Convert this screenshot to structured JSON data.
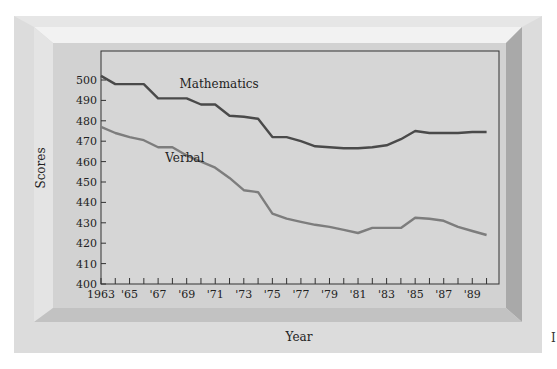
{
  "chart_data": {
    "type": "line",
    "title": "",
    "xlabel": "Year",
    "ylabel": "Scores",
    "ylim": [
      400,
      500
    ],
    "xlim": [
      1963,
      1990
    ],
    "grid": false,
    "legend": "inline labels",
    "y_ticks": [
      "400",
      "410",
      "420",
      "430",
      "440",
      "450",
      "460",
      "470",
      "480",
      "490",
      "500"
    ],
    "x_tick_labels": [
      "1963",
      "'65",
      "'67",
      "'69",
      "'71",
      "'73",
      "'75",
      "'77",
      "'79",
      "'81",
      "'83",
      "'85",
      "'87",
      "'89"
    ],
    "x": [
      1963,
      1964,
      1965,
      1966,
      1967,
      1968,
      1969,
      1970,
      1971,
      1972,
      1973,
      1974,
      1975,
      1976,
      1977,
      1978,
      1979,
      1980,
      1981,
      1982,
      1983,
      1984,
      1985,
      1986,
      1987,
      1988,
      1989,
      1990
    ],
    "series": [
      {
        "name": "Mathematics",
        "color": "#4a4a4a",
        "values": [
          502,
          498,
          498,
          498,
          491,
          491,
          491,
          488,
          488,
          482.5,
          482,
          481,
          472,
          472,
          470,
          467.5,
          467,
          466.5,
          466.5,
          467,
          468,
          471,
          475,
          474,
          474,
          474,
          474.5,
          474.5
        ]
      },
      {
        "name": "Verbal",
        "color": "#7d7d7d",
        "values": [
          477,
          474,
          472,
          470.5,
          467,
          467,
          463,
          460,
          457,
          452,
          446,
          445,
          434.5,
          432,
          430.5,
          429,
          428,
          426.5,
          425,
          427.5,
          427.5,
          427.5,
          432.5,
          432,
          431,
          428,
          426,
          424
        ]
      }
    ],
    "annotations": [
      {
        "text": "Mathematics",
        "x": 1968.5,
        "y": 496
      },
      {
        "text": "Verbal",
        "x": 1967.5,
        "y": 460
      }
    ]
  },
  "labels": {
    "y_axis_title": "Scores",
    "x_axis_title": "Year",
    "edge_fragment": "I"
  }
}
